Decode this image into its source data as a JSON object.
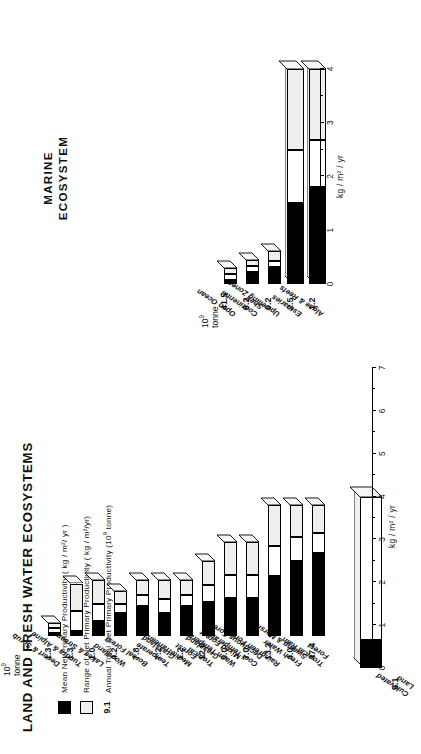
{
  "figure": {
    "title_land": "LAND AND FRESH WATER ECOSYSTEMS",
    "title_marine_line1": "MARINE",
    "title_marine_line2": "ECOSYSTEM"
  },
  "legend": {
    "items": [
      {
        "key": "mean",
        "swatch": "black",
        "label": "Mean Net Primary Productivity ( kg / m²/ yr )"
      },
      {
        "key": "range",
        "swatch": "light",
        "label": "Range of Net Primary Productivity ( kg / m²/yr)"
      },
      {
        "key": "total",
        "swatch": "9.1",
        "label": "Annual Total Net Primary Productivity (10⁹ tonne)"
      }
    ]
  },
  "axes": {
    "land": {
      "label": "kg / m² / yr",
      "ticks": [
        0,
        1,
        2,
        3,
        4,
        5,
        6,
        7
      ],
      "min": 0,
      "max": 7
    },
    "marine": {
      "label": "kg / m² / yr",
      "ticks": [
        0,
        1,
        2,
        3,
        4
      ],
      "min": 0,
      "max": 4
    },
    "total_unit_line1": "10⁹",
    "total_unit_line2": "tonne"
  },
  "chart_data": {
    "type": "bar",
    "xlabel": "",
    "ylabel": "kg / m² / yr",
    "orientation": "horizontal",
    "panels": [
      {
        "name": "LAND AND FRESH WATER ECOSYSTEMS",
        "axis": {
          "label": "kg / m² / yr",
          "ticks": [
            0,
            1,
            2,
            3,
            4,
            5,
            6,
            7
          ],
          "min": 0,
          "max": 7
        },
        "series": [
          {
            "name": "Mean Net Primary Productivity (kg/m²/yr)",
            "key": "mean"
          },
          {
            "name": "Range of Net Primary Productivity (kg/m²/yr)",
            "key": "range"
          },
          {
            "name": "Annual Total Net Primary Productivity (10⁹ tonne)",
            "key": "total"
          }
        ],
        "categories": [
          {
            "label": "Cultivated\nLand",
            "mean": 0.65,
            "range_low": 0.1,
            "range_high": 4.0,
            "total": "9.1",
            "standalone": true
          },
          {
            "label": "Tropical Rain\nForest",
            "mean": 2.2,
            "range_low": 1.0,
            "range_high": 3.5,
            "total": "47.4"
          },
          {
            "label": "Fresh Water\nSwamp & Marsh",
            "mean": 2.0,
            "range_low": 0.8,
            "range_high": 3.5,
            "total": "4.0"
          },
          {
            "label": "Raingreen Forest",
            "mean": 1.6,
            "range_low": 0.6,
            "range_high": 3.5,
            "total": "13.2"
          },
          {
            "label": "Cool Temperate\nDeciduous Forest",
            "mean": 1.0,
            "range_low": 0.6,
            "range_high": 2.5,
            "total": "7.0"
          },
          {
            "label": "Warm Temperate\nMixed Forest",
            "mean": 1.0,
            "range_low": 0.6,
            "range_high": 2.5,
            "total": "5.0"
          },
          {
            "label": "Tropical\nGrassland",
            "mean": 0.9,
            "range_low": 0.2,
            "range_high": 2.0,
            "total": "12.0"
          },
          {
            "label": "Mediterranean\nForest",
            "mean": 0.8,
            "range_low": 0.25,
            "range_high": 1.5,
            "total": "1.2"
          },
          {
            "label": "Temperate\nGrassland",
            "mean": 0.6,
            "range_low": 0.15,
            "range_high": 1.5,
            "total": "7.2"
          },
          {
            "label": "Boreal Forest",
            "mean": 0.8,
            "range_low": 0.4,
            "range_high": 1.5,
            "total": "7.8"
          },
          {
            "label": "Woodland",
            "mean": 0.6,
            "range_low": 0.25,
            "range_high": 1.2,
            "total": "4.2"
          },
          {
            "label": "Lakes & Streams",
            "mean": 0.4,
            "range_low": 0.1,
            "range_high": 1.5,
            "total": "1.0"
          },
          {
            "label": "Tundra & Alpine",
            "mean": 0.14,
            "range_low": 0.01,
            "range_high": 1.4,
            "total": "1.3"
          },
          {
            "label": "Desert & Scrub",
            "mean": 0.09,
            "range_low": 0.01,
            "range_high": 0.25,
            "total": "1.3"
          }
        ]
      },
      {
        "name": "MARINE ECOSYSTEM",
        "axis": {
          "label": "kg / m² / yr",
          "ticks": [
            0,
            1,
            2,
            3,
            4
          ],
          "min": 0,
          "max": 4
        },
        "categories": [
          {
            "label": "Algae & Reefs",
            "mean": 1.8,
            "range_low": 0.5,
            "range_high": 4.0,
            "total": "1.2"
          },
          {
            "label": "Estuaries",
            "mean": 1.5,
            "range_low": 0.5,
            "range_high": 4.0,
            "total": "2.5"
          },
          {
            "label": "Upwelling Zones",
            "mean": 0.5,
            "range_low": 0.4,
            "range_high": 1.0,
            "total": "0.2"
          },
          {
            "label": "Continental\nShelf",
            "mean": 0.36,
            "range_low": 0.2,
            "range_high": 0.6,
            "total": "9.2"
          },
          {
            "label": "Open Ocean",
            "mean": 0.13,
            "range_low": 0.02,
            "range_high": 0.4,
            "total": "41.5"
          }
        ]
      }
    ]
  }
}
